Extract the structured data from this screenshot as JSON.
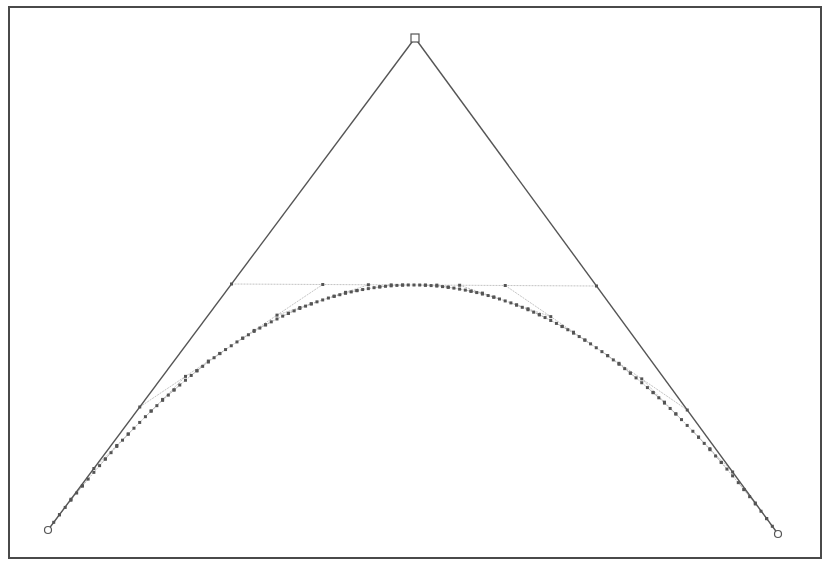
{
  "diagram": {
    "type": "quadratic-bezier-de-casteljau-subdivision",
    "control_points": [
      {
        "name": "start",
        "x": 48,
        "y": 530,
        "marker": "circle"
      },
      {
        "name": "apex",
        "x": 415,
        "y": 38,
        "marker": "square"
      },
      {
        "name": "end",
        "x": 778,
        "y": 534,
        "marker": "circle"
      }
    ],
    "subdivision_levels": 6,
    "colors": {
      "frame": "#4a4a4a",
      "control_polygon": "#555555",
      "construction_lines": "#b4b4b4",
      "vertex_dots": "#555555",
      "background": "#ffffff"
    }
  }
}
